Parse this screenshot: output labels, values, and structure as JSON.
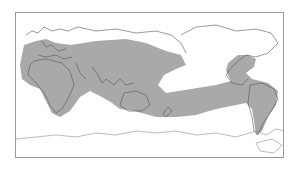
{
  "map": {
    "projection": "equirectangular, Pacific-centered",
    "colors": {
      "background": "#ffffff",
      "shaded_region": "#a9a9a9",
      "coastline": "#555555",
      "frame": "#9a9a9a"
    },
    "shaded_region_description": "Broad band covering Europe, Africa, Middle East, South and Southeast Asia, Indonesia, northern Australia, extending across the tropical Pacific to the Americas (United States, Central America, South America)",
    "regions_shaded": [
      "Europe",
      "Africa",
      "Middle East",
      "South Asia",
      "Southeast Asia",
      "Indonesia",
      "Northern Australia",
      "Tropical Pacific",
      "United States",
      "Central America",
      "South America"
    ],
    "regions_unshaded": [
      "Northern Russia / Siberia",
      "Canada",
      "Greenland",
      "Scandinavia (north)",
      "North Pacific",
      "South Pacific",
      "Southern Ocean",
      "Antarctica",
      "New Zealand",
      "Patagonia (west coast)"
    ]
  }
}
